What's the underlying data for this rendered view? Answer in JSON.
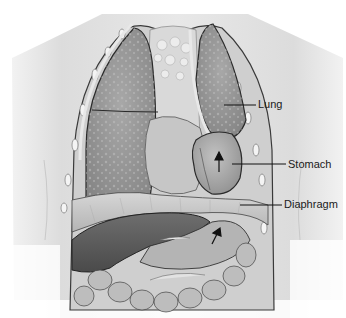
{
  "figure": {
    "style": "grayscale medical illustration",
    "labels": [
      {
        "id": "lung",
        "text": "Lung",
        "x": 258,
        "y": 99,
        "line": {
          "x1": 224,
          "y1": 105,
          "x2": 256,
          "y2": 105
        }
      },
      {
        "id": "stomach",
        "text": "Stomach",
        "x": 288,
        "y": 159,
        "line": {
          "x1": 232,
          "y1": 164,
          "x2": 286,
          "y2": 164
        }
      },
      {
        "id": "diaphragm",
        "text": "Diaphragm",
        "x": 284,
        "y": 199,
        "line": {
          "x1": 240,
          "y1": 205,
          "x2": 282,
          "y2": 205
        }
      }
    ],
    "colors": {
      "background": "#ffffff",
      "skin": "#e6e6e6",
      "lung": "#9a9a9a",
      "lung_dark": "#7d7d7d",
      "stomach": "#a8a8a8",
      "diaphragm": "#c4c4c4",
      "liver": "#5a5a5a",
      "intestine": "#b8b8b8",
      "outline": "#2a2a2a",
      "label_line": "#111111"
    }
  }
}
